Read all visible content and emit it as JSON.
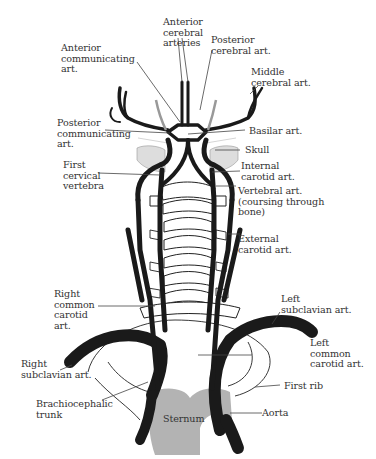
{
  "figure": {
    "colors": {
      "artery": "#1a1a1a",
      "bone_outline": "#222222",
      "sternum_fill": "#b3b3b3",
      "skull_stipple": "#bbbbbb",
      "leader_line": "#444444",
      "label_text": "#333333",
      "background": "#ffffff"
    },
    "labels": {
      "anterior_cerebral": "Anterior\ncerebral\narteries",
      "posterior_cerebral": "Posterior\ncerebral art.",
      "anterior_communicating": "Anterior\ncommunicating\nart.",
      "middle_cerebral": "Middle\ncerebral art.",
      "posterior_communicating": "Posterior\ncommunicating\nart.",
      "basilar": "Basilar art.",
      "skull": "Skull",
      "first_cervical_vertebra": "First\ncervical\nvertebra",
      "internal_carotid": "Internal\ncarotid art.",
      "vertebral": "Vertebral art.\n(coursing through\nbone)",
      "external_carotid": "External\ncarotid art.",
      "right_common_carotid": "Right\ncommon\ncarotid\nart.",
      "left_subclavian": "Left\nsubclavian art.",
      "left_common_carotid": "Left\ncommon\ncarotid art.",
      "right_subclavian": "Right\nsubclavian art.",
      "first_rib": "First rib",
      "brachiocephalic_trunk": "Brachiocephalic\ntrunk",
      "sternum": "Sternum",
      "aorta": "Aorta"
    }
  }
}
